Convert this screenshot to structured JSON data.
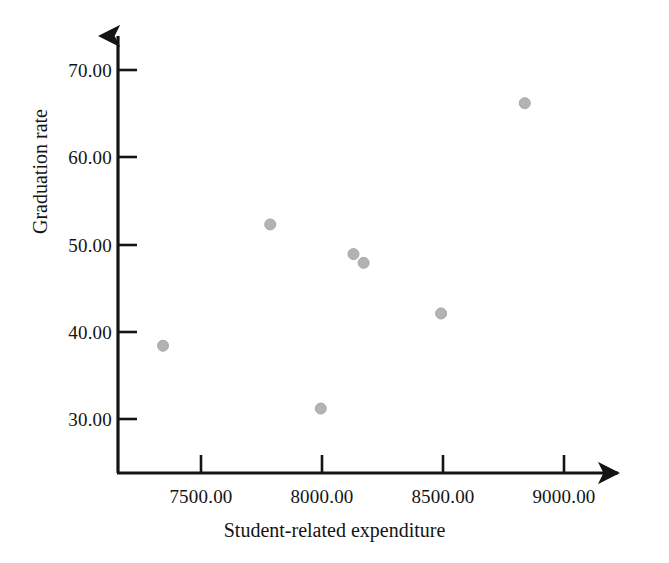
{
  "chart_data": {
    "type": "scatter",
    "title": "",
    "xlabel": "Student-related expenditure",
    "ylabel": "Graduation rate",
    "xlim": [
      7150,
      9150
    ],
    "ylim": [
      25.0,
      73.0
    ],
    "grid": false,
    "legend": null,
    "marker": {
      "shape": "circle",
      "color": "#b3b3b3",
      "edge_color": "#a8a8a8",
      "size_px": 11
    },
    "xticks": [
      7500,
      8000,
      8500,
      9000
    ],
    "xtick_labels": [
      "7500.00",
      "8000.00",
      "8500.00",
      "9000.00"
    ],
    "yticks": [
      30,
      40,
      50,
      60,
      70
    ],
    "ytick_labels": [
      "30.00",
      "40.00",
      "50.00",
      "60.00",
      "70.00"
    ],
    "points": [
      {
        "x": 7343,
        "y": 38.4
      },
      {
        "x": 7786,
        "y": 52.3
      },
      {
        "x": 7995,
        "y": 31.2
      },
      {
        "x": 8130,
        "y": 48.9
      },
      {
        "x": 8172,
        "y": 47.9
      },
      {
        "x": 8492,
        "y": 42.1
      },
      {
        "x": 8838,
        "y": 66.2
      }
    ],
    "axes_style": {
      "arrow_heads": true,
      "axis_color": "#141414",
      "axis_width_px": 3,
      "tick_direction": "inward-right"
    }
  }
}
